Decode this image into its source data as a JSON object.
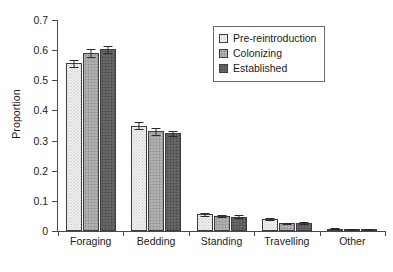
{
  "chart_data": {
    "type": "bar",
    "title": "",
    "xlabel": "",
    "ylabel": "Proportion",
    "ylim": [
      0,
      0.7
    ],
    "yticks": [
      "0",
      "0.1",
      "0.2",
      "0.3",
      "0.4",
      "0.5",
      "0.6",
      "0.7"
    ],
    "ytick_values": [
      0,
      0.1,
      0.2,
      0.3,
      0.4,
      0.5,
      0.6,
      0.7
    ],
    "grid": false,
    "legend_position": "upper right",
    "categories": [
      "Foraging",
      "Bedding",
      "Standing",
      "Travelling",
      "Other"
    ],
    "series": [
      {
        "name": "Pre-reintroduction",
        "swatch": "light",
        "color": "#efefef",
        "values": [
          0.556,
          0.35,
          0.055,
          0.039,
          0.008
        ],
        "errors": [
          0.011,
          0.01,
          0.004,
          0.003,
          0.002
        ]
      },
      {
        "name": "Colonizing",
        "swatch": "mid",
        "color": "#a8a8a8",
        "values": [
          0.59,
          0.331,
          0.05,
          0.025,
          0.005
        ],
        "errors": [
          0.014,
          0.011,
          0.004,
          0.003,
          0.002
        ]
      },
      {
        "name": "Established",
        "swatch": "dark",
        "color": "#5e5e5e",
        "values": [
          0.603,
          0.324,
          0.048,
          0.027,
          0.005
        ],
        "errors": [
          0.012,
          0.009,
          0.004,
          0.003,
          0.002
        ]
      }
    ]
  },
  "axes": {
    "y_label": "Proportion",
    "y_ticks": [
      "0.7",
      "0.6",
      "0.5",
      "0.4",
      "0.3",
      "0.2",
      "0.1",
      "0"
    ],
    "x_categories": [
      "Foraging",
      "Bedding",
      "Standing",
      "Travelling",
      "Other"
    ]
  },
  "legend": {
    "items": [
      {
        "label": "Pre-reintroduction",
        "swatch": "light"
      },
      {
        "label": "Colonizing",
        "swatch": "mid"
      },
      {
        "label": "Established",
        "swatch": "dark"
      }
    ]
  }
}
